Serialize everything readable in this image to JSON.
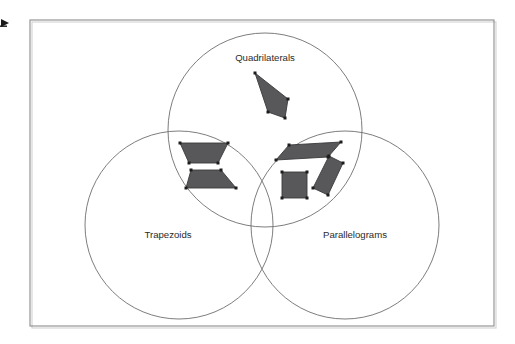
{
  "diagram": {
    "title_text": "",
    "type": "venn-three-circle",
    "background_color": "#ffffff",
    "frame": {
      "name": "outer-border",
      "x": 30,
      "y": 20,
      "width": 464,
      "height": 306,
      "stroke_color": "#8c8c8c"
    },
    "edge_mark": {
      "name": "left-edge-arrow-mark",
      "x": 1,
      "y": 19,
      "width": 8,
      "height": 8
    },
    "circles": [
      {
        "id": "quadrilaterals",
        "label": "Quadrilaterals",
        "cx": 265,
        "cy": 130,
        "r": 97,
        "label_x": 265,
        "label_y": 58,
        "stroke_color": "#6e6e6e"
      },
      {
        "id": "trapezoids",
        "label": "Trapezoids",
        "cx": 179,
        "cy": 225,
        "r": 94,
        "label_x": 168,
        "label_y": 235,
        "stroke_color": "#6e6e6e"
      },
      {
        "id": "parallelograms",
        "label": "Parallelograms",
        "cx": 345,
        "cy": 225,
        "r": 94,
        "label_x": 355,
        "label_y": 235,
        "stroke_color": "#6e6e6e"
      }
    ],
    "shapes": [
      {
        "id": "kite",
        "name": "kite-quadrilateral",
        "region": "quadrilaterals-only",
        "fill_color": "#58585a",
        "points": "255,73 288,99 285,118 268,112",
        "vertices": [
          [
            255,
            73
          ],
          [
            288,
            99
          ],
          [
            285,
            118
          ],
          [
            268,
            112
          ]
        ]
      },
      {
        "id": "trapezoid-top",
        "name": "trapezoid-wide-top",
        "region": "quadrilaterals-and-trapezoids",
        "fill_color": "#58585a",
        "points": "180,143 228,143 218,163 189,163",
        "vertices": [
          [
            180,
            143
          ],
          [
            228,
            143
          ],
          [
            218,
            163
          ],
          [
            189,
            163
          ]
        ]
      },
      {
        "id": "trapezoid-bottom",
        "name": "trapezoid-wide-bottom",
        "region": "quadrilaterals-and-trapezoids",
        "fill_color": "#58585a",
        "points": "191,170 221,170 236,188 186,188",
        "vertices": [
          [
            191,
            170
          ],
          [
            221,
            170
          ],
          [
            236,
            188
          ],
          [
            186,
            188
          ]
        ]
      },
      {
        "id": "parallelogram-flat",
        "name": "parallelogram-flat",
        "region": "quadrilaterals-and-parallelograms",
        "fill_color": "#58585a",
        "points": "289,145 341,142 328,157 276,160",
        "vertices": [
          [
            289,
            145
          ],
          [
            341,
            142
          ],
          [
            328,
            157
          ],
          [
            276,
            160
          ]
        ]
      },
      {
        "id": "rhombus-slanted",
        "name": "parallelogram-slanted",
        "region": "quadrilaterals-and-parallelograms",
        "fill_color": "#58585a",
        "points": "329,156 343,163 328,195 313,188",
        "vertices": [
          [
            329,
            156
          ],
          [
            343,
            163
          ],
          [
            328,
            195
          ],
          [
            313,
            188
          ]
        ]
      },
      {
        "id": "square",
        "name": "square",
        "region": "quadrilaterals-and-parallelograms",
        "fill_color": "#58585a",
        "points": "282,172 307,172 307,198 282,198",
        "vertices": [
          [
            282,
            172
          ],
          [
            307,
            172
          ],
          [
            307,
            198
          ],
          [
            282,
            198
          ]
        ]
      }
    ]
  }
}
